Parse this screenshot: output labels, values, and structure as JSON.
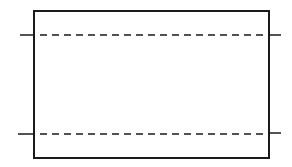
{
  "diagram": {
    "background": "#ffffff",
    "stroke_color": "#1a1a1a",
    "rectangle": {
      "x": 34,
      "y": 11,
      "width": 235,
      "height": 147,
      "stroke_width": 2
    },
    "lines": [
      {
        "name": "top-dashed-line",
        "y": 35,
        "x1": 20,
        "x2": 281,
        "dash": "7,5"
      },
      {
        "name": "bottom-dashed-line",
        "y": 134,
        "x1": 18,
        "x2": 281,
        "dash": "7,5"
      }
    ]
  }
}
